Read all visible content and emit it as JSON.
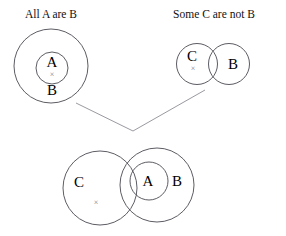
{
  "figure": {
    "kind": "euler-syllogism-diagram",
    "background_color": "#ffffff",
    "stroke_color": "#4a4a52",
    "connector_color": "#8d8d96",
    "x_mark_color": "#7a7a84",
    "text_color": "#000000"
  },
  "premise_left": {
    "title": "All A are B",
    "outer_label": "B",
    "inner_label": "A",
    "x_mark": "×"
  },
  "premise_right": {
    "title": "Some C are not B",
    "left_label": "C",
    "right_label": "B",
    "x_mark": "×"
  },
  "conclusion": {
    "left_label": "C",
    "middle_label": "A",
    "right_label": "B",
    "x_mark": "×"
  },
  "connectors": {
    "left_arm": "M 76 103 L 133 131",
    "right_arm": "M 133 131 L 205 90",
    "vertex_x": 133,
    "vertex_y": 131
  },
  "geometry": {
    "premise_left": {
      "outer_circle": {
        "cx": 51,
        "cy": 66,
        "r": 37
      },
      "inner_circle": {
        "cx": 52,
        "cy": 68,
        "r": 16
      }
    },
    "premise_right": {
      "c_circle": {
        "cx": 197,
        "cy": 64,
        "r": 20.5
      },
      "b_circle": {
        "cx": 229,
        "cy": 64,
        "r": 20.5
      }
    },
    "conclusion": {
      "c_circle": {
        "cx": 100,
        "cy": 188,
        "r": 37
      },
      "b_circle": {
        "cx": 157,
        "cy": 185,
        "r": 37
      },
      "a_circle": {
        "cx": 149,
        "cy": 181,
        "r": 19
      }
    }
  }
}
